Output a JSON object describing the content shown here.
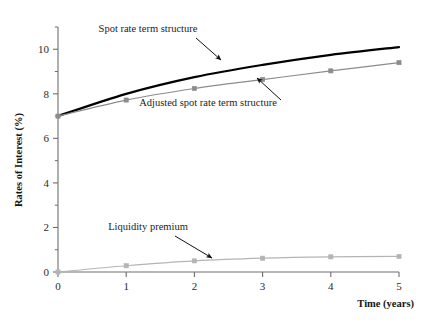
{
  "chart_data": {
    "type": "line",
    "title": "",
    "xlabel": "Time (years)",
    "ylabel": "Rates of Interest (%)",
    "x": [
      0,
      1,
      2,
      3,
      4,
      5
    ],
    "xlim": [
      0,
      5
    ],
    "ylim": [
      0,
      11
    ],
    "xticks": [
      0,
      1,
      2,
      3,
      4,
      5
    ],
    "xtick_labels": [
      "0",
      "1",
      "2",
      "3",
      "4",
      "5"
    ],
    "yticks": [
      0,
      2,
      4,
      6,
      8,
      10
    ],
    "ytick_labels": [
      "0",
      "2",
      "4",
      "6",
      "8",
      "10"
    ],
    "yminorticks": [
      1,
      3,
      5,
      7,
      9,
      11
    ],
    "grid": false,
    "legend_position": "none",
    "series": [
      {
        "name": "Spot rate term structure",
        "color": "#000000",
        "values": [
          7.0,
          8.0,
          8.75,
          9.3,
          9.75,
          10.1
        ],
        "markers": false,
        "linewidth": 2.2
      },
      {
        "name": "Adjusted spot rate term structure",
        "color": "#8c8c8c",
        "values": [
          7.0,
          7.72,
          8.24,
          8.64,
          9.03,
          9.4
        ],
        "markers": true,
        "linewidth": 1.2
      },
      {
        "name": "Liquidity premium",
        "color": "#b4b4b4",
        "values": [
          0.0,
          0.28,
          0.5,
          0.62,
          0.68,
          0.7
        ],
        "markers": true,
        "linewidth": 1.2
      }
    ],
    "annotations": [
      {
        "text": "Spot rate term structure",
        "text_x": 148,
        "text_y": 32,
        "arrow_from_x": 196,
        "arrow_from_y": 38,
        "arrow_to_x": 221,
        "arrow_to_y": 60
      },
      {
        "text": "Adjusted spot rate term structure",
        "text_x": 208,
        "text_y": 106,
        "arrow_from_x": 281,
        "arrow_from_y": 100,
        "arrow_to_x": 257,
        "arrow_to_y": 78
      },
      {
        "text": "Liquidity premium",
        "text_x": 148,
        "text_y": 230,
        "arrow_from_x": 175,
        "arrow_from_y": 236,
        "arrow_to_x": 212,
        "arrow_to_y": 258
      }
    ]
  }
}
